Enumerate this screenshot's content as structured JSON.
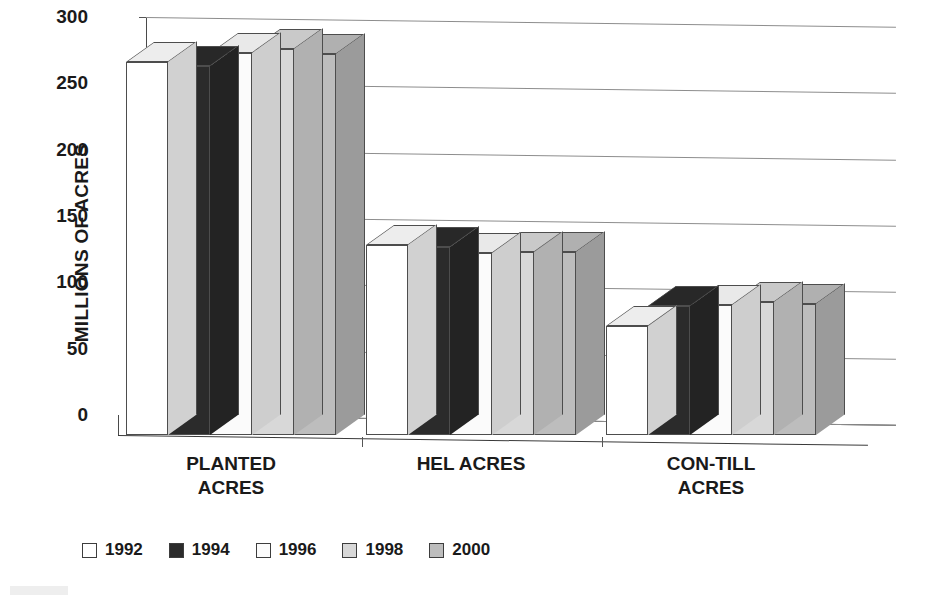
{
  "chart_data": {
    "type": "bar",
    "title": "",
    "subtitle": "",
    "xlabel": "",
    "ylabel": "MILLIONS OF ACRES",
    "categories": [
      "PLANTED ACRES",
      "HEL ACRES",
      "CON-TILL ACRES"
    ],
    "category_lines": [
      [
        "PLANTED",
        "ACRES"
      ],
      [
        "HEL ACRES"
      ],
      [
        "CON-TILL",
        "ACRES"
      ]
    ],
    "series": [
      {
        "name": "1992",
        "color": "#ffffff",
        "values": [
          281,
          143,
          82
        ]
      },
      {
        "name": "1994",
        "color": "#2b2b2b",
        "values": [
          278,
          142,
          97
        ]
      },
      {
        "name": "1996",
        "color": "#fbfbfb",
        "values": [
          288,
          137,
          98
        ]
      },
      {
        "name": "1998",
        "color": "#d8d8d8",
        "values": [
          291,
          138,
          100
        ]
      },
      {
        "name": "2000",
        "color": "#bdbdbd",
        "values": [
          287,
          138,
          99
        ]
      }
    ],
    "yticks": [
      0,
      50,
      100,
      150,
      200,
      250,
      300
    ],
    "ytick_labels": [
      "0",
      "50",
      "100",
      "150",
      "200",
      "250",
      "300"
    ],
    "ylim": [
      0,
      300
    ],
    "grid": true,
    "grid_axis": "y",
    "legend_position": "bottom-left",
    "style": "3d-clustered-column",
    "units": "millions of acres"
  },
  "axis": {
    "y_title": "MILLIONS OF ACRES"
  },
  "legend": {
    "items": [
      {
        "label": "1992",
        "color": "#ffffff"
      },
      {
        "label": "1994",
        "color": "#2b2b2b"
      },
      {
        "label": "1996",
        "color": "#fbfbfb"
      },
      {
        "label": "1998",
        "color": "#d8d8d8"
      },
      {
        "label": "2000",
        "color": "#bdbdbd"
      }
    ]
  },
  "colors": {
    "grid": "#8d8d8d",
    "axis": "#3a3a3a",
    "text": "#1a1a1a",
    "background": "#ffffff"
  }
}
